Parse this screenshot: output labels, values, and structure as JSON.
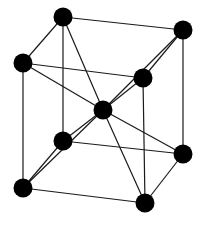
{
  "diagram": {
    "title": "Body-centered cubic unit cell",
    "colors": {
      "background": "#ffffff",
      "edge": "#1a1a1a",
      "atom": "#000000"
    },
    "atom_radius": 9.5,
    "atoms": [
      {
        "id": "top-back-left",
        "x": 63,
        "y": 17
      },
      {
        "id": "top-back-right",
        "x": 183,
        "y": 30
      },
      {
        "id": "top-front-left",
        "x": 23,
        "y": 63
      },
      {
        "id": "top-front-right",
        "x": 143,
        "y": 78
      },
      {
        "id": "center",
        "x": 103,
        "y": 110
      },
      {
        "id": "bottom-back-left",
        "x": 63,
        "y": 141
      },
      {
        "id": "bottom-back-right",
        "x": 183,
        "y": 154
      },
      {
        "id": "bottom-front-left",
        "x": 23,
        "y": 188
      },
      {
        "id": "bottom-front-right",
        "x": 145,
        "y": 203
      }
    ],
    "edges": [
      [
        "top-back-left",
        "top-back-right"
      ],
      [
        "top-back-left",
        "top-front-left"
      ],
      [
        "top-front-left",
        "top-front-right"
      ],
      [
        "top-front-right",
        "top-back-right"
      ],
      [
        "bottom-back-left",
        "bottom-back-right"
      ],
      [
        "bottom-back-left",
        "bottom-front-left"
      ],
      [
        "bottom-front-left",
        "bottom-front-right"
      ],
      [
        "bottom-front-right",
        "bottom-back-right"
      ],
      [
        "top-back-left",
        "bottom-back-left"
      ],
      [
        "top-back-right",
        "bottom-back-right"
      ],
      [
        "top-front-left",
        "bottom-front-left"
      ],
      [
        "top-front-right",
        "bottom-front-right"
      ],
      [
        "center",
        "top-back-left"
      ],
      [
        "center",
        "top-back-right"
      ],
      [
        "center",
        "top-front-left"
      ],
      [
        "center",
        "top-front-right"
      ],
      [
        "center",
        "bottom-back-left"
      ],
      [
        "center",
        "bottom-back-right"
      ],
      [
        "center",
        "bottom-front-left"
      ],
      [
        "center",
        "bottom-front-right"
      ]
    ]
  }
}
